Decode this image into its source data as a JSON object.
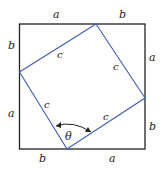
{
  "diagram": {
    "outer_color": "#222222",
    "inner_color": "#3a5fb0",
    "outer_labels": {
      "top_left": "a",
      "top_right": "b",
      "right_top": "a",
      "right_bottom": "b",
      "bottom_left": "b",
      "bottom_right": "a",
      "left_top": "b",
      "left_bottom": "a"
    },
    "inner_labels": {
      "top_left": "c",
      "top_right": "c",
      "bottom_left": "c",
      "bottom_right": "c"
    },
    "angle_label": "θ"
  }
}
